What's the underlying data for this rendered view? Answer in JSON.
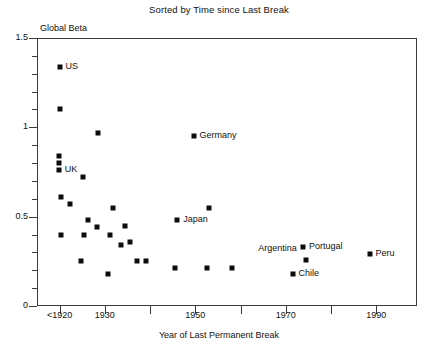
{
  "chart_data": {
    "type": "scatter",
    "title": "Sorted by Time since Last Break",
    "xlabel": "Year of Last Permanent Break",
    "ylabel": "Global Beta",
    "xlim": [
      1915,
      1999
    ],
    "ylim": [
      0,
      1.5
    ],
    "grid": false,
    "legend": "none",
    "x_ticks": [
      {
        "value": 1920,
        "label": "<1920"
      },
      {
        "value": 1930,
        "label": "1930"
      },
      {
        "value": 1950,
        "label": "1950"
      },
      {
        "value": 1970,
        "label": "1970"
      },
      {
        "value": 1990,
        "label": "1990"
      }
    ],
    "x_minor_ticks": [
      1940,
      1960,
      1980
    ],
    "y_ticks": [
      {
        "value": 0,
        "label": "0"
      },
      {
        "value": 0.5,
        "label": "0.5"
      },
      {
        "value": 1,
        "label": "1"
      },
      {
        "value": 1.5,
        "label": "1.5"
      }
    ],
    "y_minor_ticks": [
      0.1,
      0.2,
      0.3,
      0.4,
      0.6,
      0.7,
      0.8,
      0.9,
      1.1,
      1.2,
      1.3,
      1.4
    ],
    "marker": {
      "shape": "square",
      "color": "#0d0d0d",
      "size": 5
    },
    "points": [
      {
        "x": 1920,
        "y": 1.34,
        "label": "US",
        "label_pos": "right"
      },
      {
        "x": 1920,
        "y": 1.1,
        "label": "",
        "label_pos": "right"
      },
      {
        "x": 1928.5,
        "y": 0.97,
        "label": "",
        "label_pos": "right"
      },
      {
        "x": 1919.8,
        "y": 0.84,
        "label": "",
        "label_pos": "right"
      },
      {
        "x": 1919.8,
        "y": 0.8,
        "label": "",
        "label_pos": "right"
      },
      {
        "x": 1919.8,
        "y": 0.76,
        "label": "UK",
        "label_pos": "right"
      },
      {
        "x": 1925.2,
        "y": 0.72,
        "label": "",
        "label_pos": "right"
      },
      {
        "x": 1920.2,
        "y": 0.61,
        "label": "",
        "label_pos": "right"
      },
      {
        "x": 1922.2,
        "y": 0.57,
        "label": "",
        "label_pos": "right"
      },
      {
        "x": 1931.8,
        "y": 0.55,
        "label": "",
        "label_pos": "right"
      },
      {
        "x": 1926.2,
        "y": 0.48,
        "label": "",
        "label_pos": "right"
      },
      {
        "x": 1928.3,
        "y": 0.44,
        "label": "",
        "label_pos": "right"
      },
      {
        "x": 1934.5,
        "y": 0.45,
        "label": "",
        "label_pos": "right"
      },
      {
        "x": 1920.2,
        "y": 0.4,
        "label": "",
        "label_pos": "right"
      },
      {
        "x": 1925.3,
        "y": 0.4,
        "label": "",
        "label_pos": "right"
      },
      {
        "x": 1931.2,
        "y": 0.4,
        "label": "",
        "label_pos": "right"
      },
      {
        "x": 1933.5,
        "y": 0.34,
        "label": "",
        "label_pos": "right"
      },
      {
        "x": 1935.5,
        "y": 0.36,
        "label": "",
        "label_pos": "right"
      },
      {
        "x": 1924.8,
        "y": 0.25,
        "label": "",
        "label_pos": "right"
      },
      {
        "x": 1937.2,
        "y": 0.25,
        "label": "",
        "label_pos": "right"
      },
      {
        "x": 1939,
        "y": 0.25,
        "label": "",
        "label_pos": "right"
      },
      {
        "x": 1930.8,
        "y": 0.18,
        "label": "",
        "label_pos": "right"
      },
      {
        "x": 1945.5,
        "y": 0.21,
        "label": "",
        "label_pos": "right"
      },
      {
        "x": 1952.5,
        "y": 0.21,
        "label": "",
        "label_pos": "right"
      },
      {
        "x": 1958.0,
        "y": 0.21,
        "label": "",
        "label_pos": "right"
      },
      {
        "x": 1949.6,
        "y": 0.95,
        "label": "Germany",
        "label_pos": "right"
      },
      {
        "x": 1946.0,
        "y": 0.48,
        "label": "Japan",
        "label_pos": "right"
      },
      {
        "x": 1953.0,
        "y": 0.55,
        "label": "",
        "label_pos": "right"
      },
      {
        "x": 1973.8,
        "y": 0.33,
        "label": "Portugal",
        "label_pos": "right"
      },
      {
        "x": 1974.5,
        "y": 0.26,
        "label": "Argentina",
        "label_pos": "above-left"
      },
      {
        "x": 1971.5,
        "y": 0.18,
        "label": "Chile",
        "label_pos": "right"
      },
      {
        "x": 1988.5,
        "y": 0.29,
        "label": "Peru",
        "label_pos": "right"
      }
    ]
  }
}
